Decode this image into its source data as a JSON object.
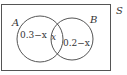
{
  "diagram": {
    "type": "venn",
    "universal_set_label": "S",
    "sets": [
      {
        "label": "A",
        "region_only": "0.3−x"
      },
      {
        "label": "B",
        "region_only": "0.2−x"
      }
    ],
    "intersection": "x",
    "colors": {
      "stroke": "#555555",
      "text": "#333333",
      "background": "#ffffff"
    }
  }
}
